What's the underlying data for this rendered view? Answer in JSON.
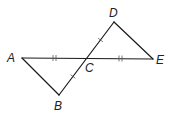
{
  "diagram": {
    "type": "geometry",
    "points": {
      "A": {
        "label": "A",
        "x": 22,
        "y": 58
      },
      "B": {
        "label": "B",
        "x": 59,
        "y": 95
      },
      "C": {
        "label": "C",
        "x": 87,
        "y": 58
      },
      "D": {
        "label": "D",
        "x": 114,
        "y": 22
      },
      "E": {
        "label": "E",
        "x": 153,
        "y": 59
      }
    },
    "segments": [
      {
        "from": "A",
        "to": "E",
        "through": "C"
      },
      {
        "from": "B",
        "to": "D",
        "through": "C"
      },
      {
        "from": "A",
        "to": "B"
      },
      {
        "from": "D",
        "to": "E"
      }
    ],
    "congruence_marks": [
      {
        "segment": "AC",
        "ticks": 2
      },
      {
        "segment": "CE",
        "ticks": 2
      },
      {
        "segment": "BC",
        "ticks": 1
      },
      {
        "segment": "CD",
        "ticks": 1
      }
    ],
    "colors": {
      "line": "#1a1a1a",
      "tick": "#555555",
      "label": "#222222"
    }
  }
}
